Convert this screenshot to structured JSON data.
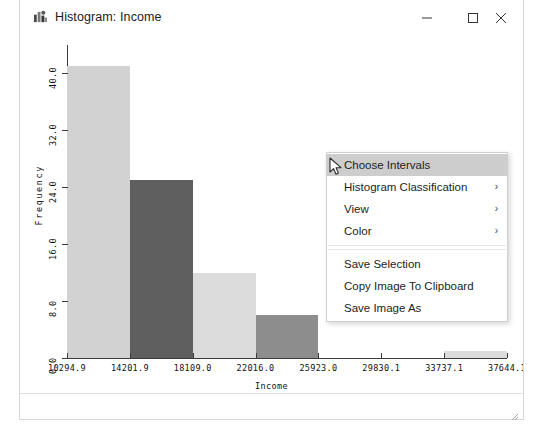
{
  "window": {
    "title": "Histogram: Income",
    "icon": "histogram-app-icon",
    "controls": {
      "minimize": "minimize-icon",
      "maximize": "maximize-icon",
      "close": "close-icon"
    }
  },
  "chart_data": {
    "type": "bar",
    "title": "Histogram: Income",
    "xlabel": "Income",
    "ylabel": "Frequency",
    "x_tick_labels": [
      "10294.9",
      "14201.9",
      "18109.0",
      "22016.0",
      "25923.0",
      "29830.1",
      "33737.1",
      "37644.1"
    ],
    "y_tick_labels": [
      "0.0",
      "8.0",
      "16.0",
      "24.0",
      "32.0",
      "40.0"
    ],
    "ylim": [
      0,
      44
    ],
    "xlim": [
      10294.9,
      37644.1
    ],
    "grid": false,
    "legend": null,
    "bin_width": 3907.1,
    "bins": [
      {
        "x0": 10294.9,
        "x1": 14201.9,
        "value": 41,
        "color": "#d2d2d2"
      },
      {
        "x0": 14201.9,
        "x1": 18109.0,
        "value": 25,
        "color": "#5f5f5f"
      },
      {
        "x0": 18109.0,
        "x1": 22016.0,
        "value": 12,
        "color": "#dcdcdc"
      },
      {
        "x0": 22016.0,
        "x1": 25923.0,
        "value": 6,
        "color": "#8d8d8d"
      },
      {
        "x0": 25923.0,
        "x1": 29830.1,
        "value": 0,
        "color": "#ffffff"
      },
      {
        "x0": 29830.1,
        "x1": 33737.1,
        "value": 0,
        "color": "#ffffff"
      },
      {
        "x0": 33737.1,
        "x1": 37644.1,
        "value": 1,
        "color": "#dcdcdc"
      }
    ],
    "categories": [
      "10294.9-14201.9",
      "14201.9-18109.0",
      "18109.0-22016.0",
      "22016.0-25923.0",
      "25923.0-29830.1",
      "29830.1-33737.1",
      "33737.1-37644.1"
    ],
    "values": [
      41,
      25,
      12,
      6,
      0,
      0,
      1
    ]
  },
  "context_menu": {
    "items": [
      {
        "label": "Choose Intervals",
        "submenu": false,
        "highlighted": true
      },
      {
        "label": "Histogram Classification",
        "submenu": true,
        "highlighted": false
      },
      {
        "label": "View",
        "submenu": true,
        "highlighted": false
      },
      {
        "separator_after": true,
        "label": "Color",
        "submenu": true,
        "highlighted": false
      },
      {
        "label": "Save Selection",
        "submenu": false,
        "highlighted": false
      },
      {
        "label": "Copy Image To Clipboard",
        "submenu": false,
        "highlighted": false
      },
      {
        "label": "Save Image As",
        "submenu": false,
        "highlighted": false
      }
    ],
    "submenu_glyph": "›"
  },
  "colors": {
    "highlight": "#cdcdcd",
    "bar_light": "#d2d2d2",
    "bar_dark": "#5f5f5f",
    "bar_mid": "#8d8d8d",
    "axis": "#3b3b3b"
  }
}
